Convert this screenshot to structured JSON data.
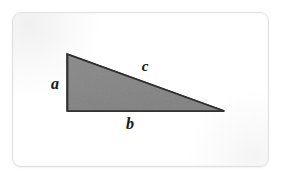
{
  "figure": {
    "name": "right-triangle-labeled-sides",
    "background_color": "#ffffff",
    "frame": {
      "border_color": "#e2e2e2",
      "fill_color": "#ffffff",
      "corner_radius": 9,
      "x": 12,
      "y": 12,
      "width": 257,
      "height": 155
    },
    "shape": {
      "type": "triangle",
      "fill_color": "#808080",
      "stroke_color": "#3a3a3a",
      "stroke_width": 1.6,
      "vertices": [
        {
          "name": "apex-top-left",
          "x": 67,
          "y": 54
        },
        {
          "name": "corner-bottom-left",
          "x": 67,
          "y": 111
        },
        {
          "name": "corner-bottom-right",
          "x": 224,
          "y": 111
        }
      ],
      "right_angle_at": "corner-bottom-left"
    },
    "labels": [
      {
        "id": "a",
        "text": "a",
        "side": "vertical-leg",
        "x": 55,
        "y": 84,
        "color": "#1b1b1b"
      },
      {
        "id": "b",
        "text": "b",
        "side": "horizontal-leg",
        "x": 130,
        "y": 124,
        "color": "#1b1b1b"
      },
      {
        "id": "c",
        "text": "c",
        "side": "hypotenuse",
        "x": 145,
        "y": 66,
        "color": "#1b1b1b"
      }
    ]
  }
}
